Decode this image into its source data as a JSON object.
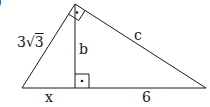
{
  "figure": {
    "part_label": ")",
    "labels": {
      "left_side": {
        "coefficient": "3",
        "radical_symbol": "√",
        "radicand": "3"
      },
      "altitude": "b",
      "hypotenuse_right": "c",
      "segment_left": "x",
      "segment_right": "6"
    },
    "colors": {
      "stroke": "#1a1a1a",
      "background": "#ffffff"
    },
    "geometry": {
      "top_vertex": [
        75,
        4
      ],
      "bottom_left_vertex": [
        22,
        88
      ],
      "bottom_right_vertex": [
        206,
        88
      ],
      "altitude_foot": [
        75,
        88
      ],
      "right_angle_markers": [
        "top_vertex",
        "altitude_foot"
      ]
    }
  }
}
